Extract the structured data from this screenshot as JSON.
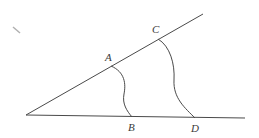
{
  "diagram": {
    "type": "geometry-angle-construction",
    "colors": {
      "stroke": "#4a4a4a",
      "label": "#3a3a3a",
      "background": "#ffffff",
      "mark": "#b0b0b0"
    },
    "vertex": {
      "x": 26,
      "y": 115
    },
    "rays": [
      {
        "name": "upper-ray",
        "from": [
          26,
          115
        ],
        "to": [
          203,
          14
        ]
      },
      {
        "name": "lower-ray",
        "from": [
          26,
          115
        ],
        "to": [
          245,
          118
        ]
      }
    ],
    "points": [
      {
        "id": "A",
        "label": "A",
        "x": 111,
        "y": 66,
        "label_x": 105,
        "label_y": 61
      },
      {
        "id": "C",
        "label": "C",
        "x": 158,
        "y": 39,
        "label_x": 152,
        "label_y": 33
      },
      {
        "id": "B",
        "label": "B",
        "x": 132,
        "y": 117,
        "label_x": 128,
        "label_y": 131
      },
      {
        "id": "D",
        "label": "D",
        "x": 195,
        "y": 118,
        "label_x": 191,
        "label_y": 132
      }
    ],
    "arcs": [
      {
        "name": "arc-AB",
        "from": "A",
        "to": "B"
      },
      {
        "name": "arc-CD",
        "from": "C",
        "to": "D"
      }
    ]
  }
}
